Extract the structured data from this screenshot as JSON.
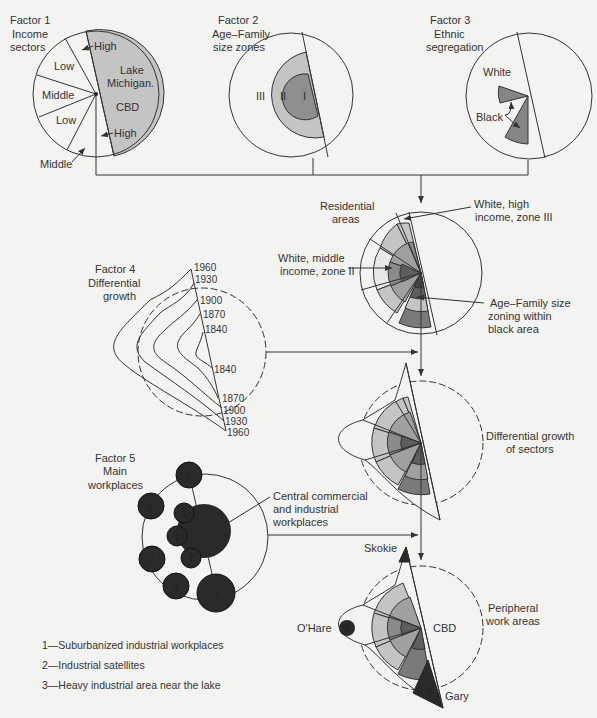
{
  "colors": {
    "background": "#f3f3f1",
    "light_gray": "#c8c8c8",
    "mid_gray": "#a6a6a6",
    "dark_gray": "#7a7a7a",
    "darker_gray": "#5a5a5a",
    "workplace_black": "#2a2a2a",
    "line": "#333333"
  },
  "factor1": {
    "title": "Factor 1",
    "subtitle1": "Income",
    "subtitle2": "sectors",
    "sectors": [
      "High",
      "Low",
      "Middle",
      "Low",
      "Middle",
      "High"
    ],
    "lake_label1": "Lake",
    "lake_label2": "Michigan.",
    "cbd_label": "CBD"
  },
  "factor2": {
    "title": "Factor 2",
    "subtitle1": "Age–Family",
    "subtitle2": "size zones",
    "zones": [
      "III",
      "II",
      "I"
    ]
  },
  "factor3": {
    "title": "Factor 3",
    "subtitle1": "Ethnic",
    "subtitle2": "segregation",
    "white_label": "White",
    "black_label": "Black"
  },
  "residential": {
    "title1": "Residential",
    "title2": "areas",
    "callout_high1": "White, high",
    "callout_high2": "income, zone III",
    "callout_mid1": "White, middle",
    "callout_mid2": "income, zone II",
    "callout_age1": "Age–Family size",
    "callout_age2": "zoning within",
    "callout_age3": "black area"
  },
  "factor4": {
    "title": "Factor 4",
    "subtitle1": "Differential",
    "subtitle2": "growth",
    "years_top": [
      "1960",
      "1930",
      "1900",
      "1870",
      "1840"
    ],
    "years_bottom": [
      "1840",
      "1870",
      "1900",
      "1930",
      "1960"
    ]
  },
  "growth": {
    "label1": "Differential growth",
    "label2": "of sectors"
  },
  "factor5": {
    "title": "Factor 5",
    "subtitle1": "Main",
    "subtitle2": "workplaces",
    "callout1": "Central commercial",
    "callout2": "and industrial",
    "callout3": "workplaces",
    "markers": [
      "2",
      "2",
      "2",
      "2",
      "1",
      "1",
      "1",
      "3"
    ]
  },
  "final": {
    "skokie": "Skokie",
    "ohare": "O'Hare",
    "cbd": "CBD",
    "gary": "Gary",
    "peripheral1": "Peripheral",
    "peripheral2": "work areas",
    "ohare_marker": "2",
    "gary_marker": "3",
    "skokie_marker": "2"
  },
  "legend": {
    "items": [
      "1—Suburbanized industrial workplaces",
      "2—Industrial satellites",
      "3—Heavy industrial area near the lake"
    ]
  }
}
